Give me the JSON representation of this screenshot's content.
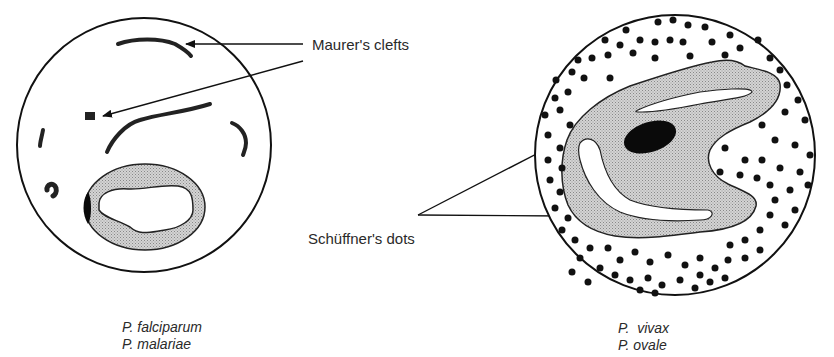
{
  "labels": {
    "maurers_clefts": "Maurer's clefts",
    "schuffners_dots": "Schüffner's dots"
  },
  "left_cell": {
    "species": [
      "P. falciparum",
      "P. malariae"
    ]
  },
  "right_cell": {
    "species": [
      "P.  vivax",
      "P. ovale"
    ]
  },
  "colors": {
    "outline": "#111111",
    "cytoplasm_fill": "#c8c8c8",
    "chromatin": "#0a0a0a",
    "background": "#ffffff"
  }
}
